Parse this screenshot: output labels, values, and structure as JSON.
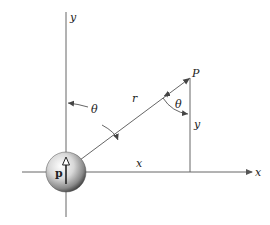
{
  "diagram": {
    "type": "dipole-coordinate-geometry",
    "labels": {
      "y_axis": "y",
      "x_axis": "x",
      "point": "P",
      "radius": "r",
      "theta_at_origin": "θ",
      "theta_at_point": "θ",
      "y_segment": "y",
      "x_segment": "x",
      "dipole_moment": "p"
    },
    "colors": {
      "line": "#555555",
      "text": "#222222",
      "background": "#ffffff"
    }
  }
}
